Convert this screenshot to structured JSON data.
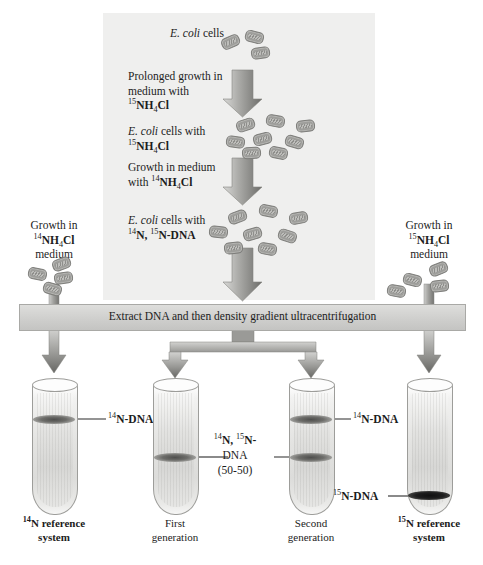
{
  "figure": {
    "title_semantic": "meselson-stahl-density-gradient-experiment"
  },
  "culture_panel": {
    "steps": [
      {
        "id": "ecoli-cells",
        "html": "<i>E. coli</i> cells"
      },
      {
        "id": "prolonged-growth",
        "line1": "Prolonged growth in",
        "line2": "medium with",
        "line3_pre": "",
        "iso": "15",
        "chem": "NH",
        "sub": "4",
        "chem2": "Cl"
      },
      {
        "id": "ecoli-15n",
        "line1_pre": "E. coli",
        "line1_post": " cells with",
        "iso": "15",
        "chem": "NH",
        "sub": "4",
        "chem2": "Cl"
      },
      {
        "id": "growth-14n",
        "line1": "Growth in medium",
        "line2_pre": "with ",
        "iso": "14",
        "chem": "NH",
        "sub": "4",
        "chem2": "Cl"
      },
      {
        "id": "ecoli-hybrid",
        "line1_pre": "E. coli",
        "line1_post": " cells with",
        "iso_a": "14",
        "n_a": "N, ",
        "iso_b": "15",
        "n_b": "N-DNA"
      }
    ],
    "labels": {
      "ecoli_cells": "E. coli cells",
      "prolonged_growth_l1": "Prolonged growth in",
      "prolonged_growth_l2": "medium with",
      "ecoli_cells_with": " cells with",
      "growth_in_medium": "Growth in medium",
      "with_prefix": "with ",
      "ecoli_italic": "E. coli"
    }
  },
  "side_flasks": {
    "left": {
      "name": "growth-14n-medium",
      "line1": "Growth in",
      "iso": "14",
      "chem": "NH",
      "sub": "4",
      "chem2": "Cl",
      "line3": "medium"
    },
    "right": {
      "name": "growth-15n-medium",
      "line1": "Growth in",
      "iso": "15",
      "chem": "NH",
      "sub": "4",
      "chem2": "Cl",
      "line3": "medium"
    }
  },
  "extraction": {
    "label": "Extract DNA and then density gradient ultracentrifugation"
  },
  "tubes": [
    {
      "name": "tube-14n-reference",
      "caption_iso": "14",
      "caption_l1": "N reference",
      "caption_l2": "system",
      "caption_bold": true,
      "band_label_iso": "14",
      "band_label_text": "N-DNA",
      "bands": [
        {
          "type": "light",
          "position_pct": 30
        }
      ]
    },
    {
      "name": "tube-first-generation",
      "caption_l1": "First",
      "caption_l2": "generation",
      "caption_bold": false,
      "bands": [
        {
          "type": "light",
          "position_pct": 58
        }
      ]
    },
    {
      "name": "tube-second-generation",
      "caption_l1": "Second",
      "caption_l2": "generation",
      "caption_bold": false,
      "band_label_iso": "14",
      "band_label_text": "N-DNA",
      "bands": [
        {
          "type": "light",
          "position_pct": 30
        },
        {
          "type": "light",
          "position_pct": 58
        }
      ]
    },
    {
      "name": "tube-15n-reference",
      "caption_iso": "15",
      "caption_l1": "N reference",
      "caption_l2": "system",
      "caption_bold": true,
      "band_label_iso": "15",
      "band_label_text": "N-DNA",
      "bands": [
        {
          "type": "dark",
          "position_pct": 92
        }
      ]
    }
  ],
  "center_callout": {
    "name": "hybrid-dna-callout",
    "iso_a": "14",
    "n_a": "N, ",
    "iso_b": "15",
    "n_b": "N-",
    "line2": "DNA",
    "line3": "(50-50)"
  },
  "colors": {
    "panel_bg": "#efefee",
    "arrow_dark": "#6f6f6c",
    "arrow_light": "#cfcfcd",
    "bar_bg": "#d4d4d2",
    "text": "#1c1c1c",
    "band_light": "#6d6d6a",
    "band_dark": "#141414"
  }
}
